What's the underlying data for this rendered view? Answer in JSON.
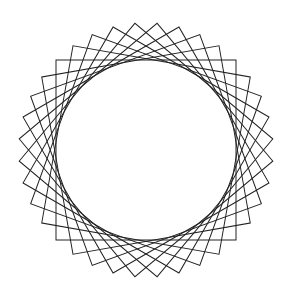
{
  "figure": {
    "background": "#ffffff",
    "stroke_color": "#222222",
    "stroke_width": 1,
    "center": [
      146,
      150
    ],
    "half_side": 90,
    "square_count": 9,
    "rotation_step_deg": 10
  }
}
